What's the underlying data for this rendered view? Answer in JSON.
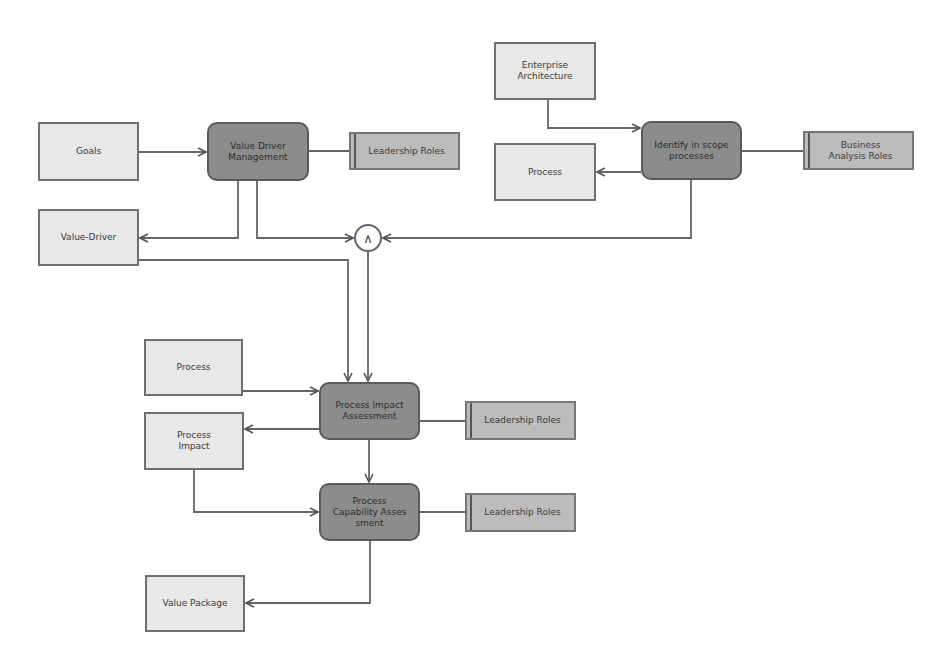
{
  "diagram": {
    "colors": {
      "artifact_fill": "#e8e8e8",
      "activity_fill": "#8c8c8c",
      "role_fill": "#bcbcbc",
      "line": "#555555"
    },
    "nodes": {
      "goals": "Goals",
      "value_driver_management": "Value Driver\nManagement",
      "leadership_roles_1": "Leadership Roles",
      "value_driver": "Value-Driver",
      "enterprise_architecture": "Enterprise\nArchitecture",
      "process_top": "Process",
      "identify_in_scope_processes": "Identify in scope\nprocesses",
      "business_analysis_roles": "Business\nAnalysis Roles",
      "and_gate": "∧",
      "process_mid": "Process",
      "process_impact_assessment": "Process Impact\nAssessment",
      "leadership_roles_2": "Leadership Roles",
      "process_impact": "Process\nImpact",
      "process_capability_assessment": "Process\nCapability Asses\nsment",
      "leadership_roles_3": "Leadership Roles",
      "value_package": "Value Package"
    }
  }
}
